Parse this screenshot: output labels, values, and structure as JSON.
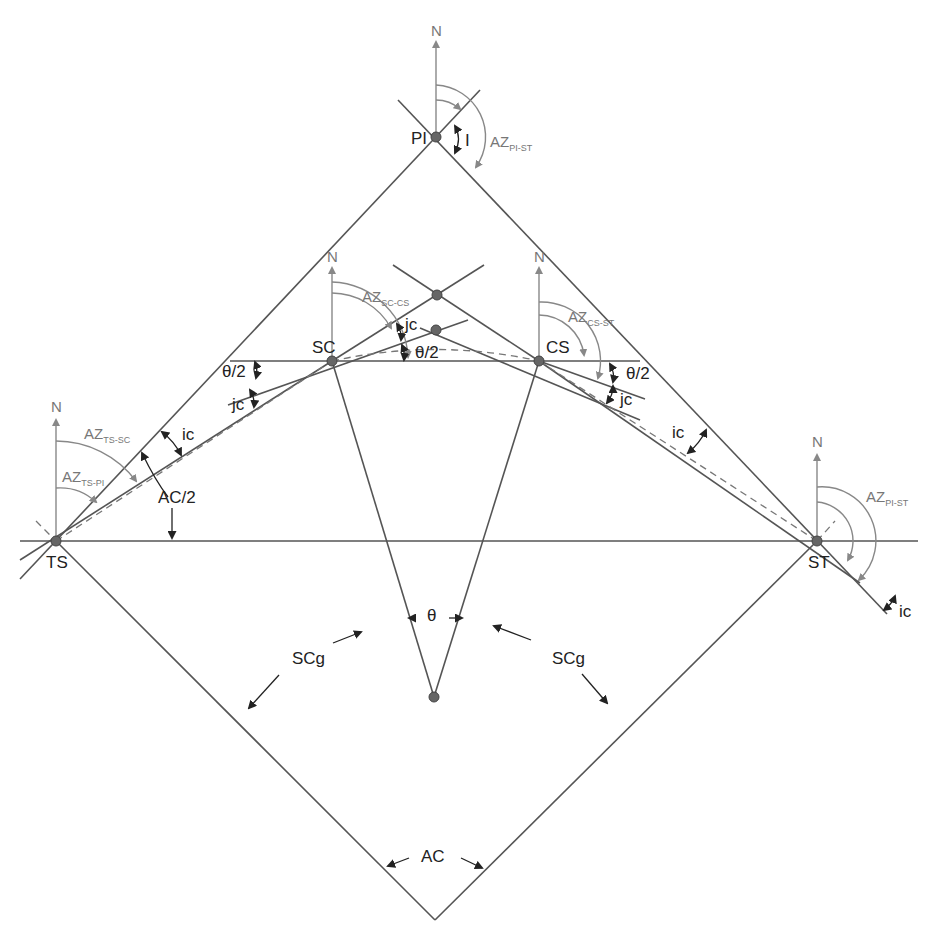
{
  "diagram": {
    "type": "spiral-curve-geometry",
    "points": {
      "PI": "PI",
      "TS": "TS",
      "ST": "ST",
      "SC": "SC",
      "CS": "CS"
    },
    "north": "N",
    "azimuths": {
      "pi_st_top": {
        "main": "AZ",
        "sub": "PI-ST"
      },
      "sc_cs": {
        "main": "AZ",
        "sub": "SC-CS"
      },
      "cs_st": {
        "main": "AZ",
        "sub": "CS-ST"
      },
      "ts_sc": {
        "main": "AZ",
        "sub": "TS-SC"
      },
      "ts_pi": {
        "main": "AZ",
        "sub": "TS-PI"
      },
      "pi_st_right": {
        "main": "AZ",
        "sub": "PI-ST"
      }
    },
    "angles": {
      "I": "I",
      "theta_half": "θ/2",
      "jc": "jc",
      "ic": "ic",
      "ac_half": "AC/2",
      "theta": "θ",
      "scg": "SCg",
      "ac": "AC"
    },
    "colors": {
      "line": "#555555",
      "north_arrow": "#888888",
      "label": "#222222",
      "azimuth_label": "#777777",
      "point": "#666666"
    }
  }
}
